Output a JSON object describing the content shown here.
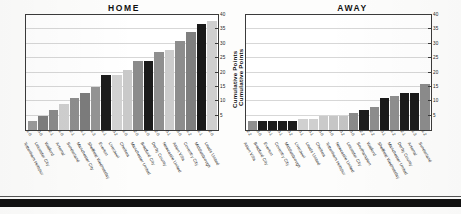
{
  "page": {
    "background": "#fdfdfc",
    "bottom_rule_color": "#111111"
  },
  "axis": {
    "y_title": "Cumulative Points",
    "y_ticks": [
      5,
      10,
      15,
      20,
      25,
      30,
      35,
      40
    ],
    "y_min": 0,
    "y_max": 40
  },
  "chart_data": [
    {
      "type": "bar",
      "title": "HOME",
      "xlabel": "",
      "ylabel": "Cumulative Points",
      "ylim": [
        0,
        40
      ],
      "yticks": [
        5,
        10,
        15,
        20,
        25,
        30,
        35,
        40
      ],
      "grid": true,
      "legend": "none",
      "categories": [
        "Tottenham Hotspur",
        "Leicester City",
        "Watford",
        "Arsenal",
        "Sunderland",
        "Manchester City",
        "Sheffield Wednesday",
        "Everton",
        "Liverpool",
        "Chelsea",
        "Manchester United",
        "Bradford City",
        "Derby County",
        "Newcastle United",
        "Aston Villa",
        "Coventry City",
        "Middlesbrough",
        "Leeds United"
      ],
      "values": [
        3,
        5,
        7,
        9,
        11,
        13,
        15,
        19,
        19,
        21,
        24,
        24,
        27,
        28,
        31,
        34,
        37,
        38
      ],
      "point_labels": [
        "1-0",
        "0-0",
        "2-1",
        "1-0",
        "2-1",
        "1-1",
        "1-3",
        "1-1",
        "0-2",
        "1-0",
        "2-0",
        "1-0",
        "2-0",
        "0-1",
        "3-0",
        "1-2",
        "1-1",
        "2-0"
      ],
      "bar_colors": [
        "#9b9b9b",
        "#7e7e7e",
        "#8a8a8a",
        "#cfcfcf",
        "#8e8e8e",
        "#7c7c7c",
        "#949494",
        "#1c1c1c",
        "#d2d2d2",
        "#c9c9c9",
        "#8b8b8b",
        "#1b1b1b",
        "#8f8f8f",
        "#cccccc",
        "#8d8d8d",
        "#7f7f7f",
        "#191919",
        "#cfcfcf"
      ]
    },
    {
      "type": "bar",
      "title": "AWAY",
      "xlabel": "",
      "ylabel": "Cumulative Points",
      "ylim": [
        0,
        40
      ],
      "yticks": [
        5,
        10,
        15,
        20,
        25,
        30,
        35,
        40
      ],
      "grid": true,
      "legend": "none",
      "categories": [
        "Aston Villa",
        "Bradford City",
        "Everton",
        "Coventry City",
        "Middlesbrough",
        "Liverpool",
        "Leeds United",
        "Chelsea",
        "Tottenham Hotspur",
        "Newcastle United",
        "Leicester City",
        "Southampton",
        "Watford",
        "Sheffield Wednesday",
        "Manchester United",
        "Derby County",
        "Arsenal",
        "Sunderland"
      ],
      "values": [
        3,
        3,
        3,
        3,
        3,
        4,
        4,
        5,
        5,
        5,
        6,
        7,
        8,
        11,
        12,
        13,
        13,
        16
      ],
      "point_labels": [
        "2-2",
        "3-0",
        "0-1",
        "0-1",
        "0-2",
        "0-1",
        "0-1",
        "0-0",
        "0-0",
        "0-2",
        "0-0",
        "2-2",
        "2-2",
        "0-1",
        "1-2",
        "2-1",
        "1-3",
        "1-2",
        "0-1"
      ],
      "bar_colors": [
        "#8f8f8f",
        "#1b1b1b",
        "#1b1b1b",
        "#1b1b1b",
        "#1b1b1b",
        "#d0d0d0",
        "#cfcfcf",
        "#cacaca",
        "#c6c6c6",
        "#c4c4c4",
        "#8a8a8a",
        "#1c1c1c",
        "#8d8d8d",
        "#1a1a1a",
        "#8e8e8e",
        "#1b1b1b",
        "#1b1b1b",
        "#8c8c8c"
      ]
    }
  ]
}
